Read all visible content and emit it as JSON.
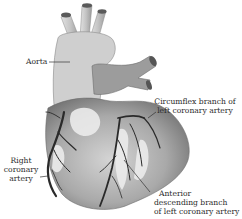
{
  "figure": {
    "labels": {
      "aorta": "Aorta",
      "circumflex": [
        "Circumflex branch of",
        "left coronary artery"
      ],
      "right_coronary": [
        "Right",
        "coronary",
        "artery"
      ],
      "anterior_descending": [
        "Anterior",
        "descending branch",
        "of left coronary artery"
      ]
    }
  }
}
